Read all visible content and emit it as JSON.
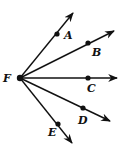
{
  "diagram": {
    "vertex": {
      "label": "F",
      "x": 20,
      "y": 78,
      "label_x": 3,
      "label_y": 82
    },
    "rays": [
      {
        "id": "A",
        "point": {
          "x": 57,
          "y": 34
        },
        "tip": {
          "x": 73,
          "y": 13
        },
        "label_x": 64,
        "label_y": 39
      },
      {
        "id": "B",
        "point": {
          "x": 88,
          "y": 43
        },
        "tip": {
          "x": 114,
          "y": 31
        },
        "label_x": 92,
        "label_y": 56
      },
      {
        "id": "C",
        "point": {
          "x": 88,
          "y": 78
        },
        "tip": {
          "x": 117,
          "y": 78
        },
        "label_x": 87,
        "label_y": 92
      },
      {
        "id": "D",
        "point": {
          "x": 83,
          "y": 108
        },
        "tip": {
          "x": 110,
          "y": 121
        },
        "label_x": 78,
        "label_y": 124
      },
      {
        "id": "E",
        "point": {
          "x": 58,
          "y": 124
        },
        "tip": {
          "x": 72,
          "y": 143
        },
        "label_x": 48,
        "label_y": 136
      }
    ],
    "color": "#111111"
  }
}
